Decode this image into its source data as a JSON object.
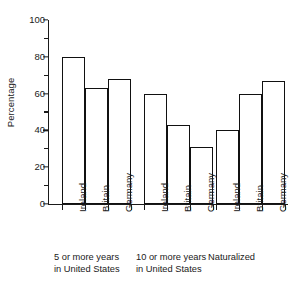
{
  "chart_data": {
    "type": "bar",
    "title": "",
    "subtitle": "",
    "xlabel": "",
    "ylabel": "Percentage",
    "ylim": [
      0,
      100
    ],
    "y_ticks_major": [
      0,
      20,
      40,
      60,
      80,
      100
    ],
    "y_ticks_minor": [
      10,
      30,
      50,
      70,
      90
    ],
    "y_tick_labels": [
      "0",
      "20",
      "40",
      "60",
      "80",
      "100"
    ],
    "grid": false,
    "legend": null,
    "categories": [
      "Ireland",
      "Britain",
      "Germany"
    ],
    "groups": [
      {
        "caption_line1": "5 or more years",
        "caption_line2": "in United States",
        "bars": [
          {
            "category": "Ireland",
            "value": 80
          },
          {
            "category": "Britain",
            "value": 63
          },
          {
            "category": "Germany",
            "value": 68
          }
        ]
      },
      {
        "caption_line1": "10 or more years",
        "caption_line2": "in United States",
        "bars": [
          {
            "category": "Ireland",
            "value": 60
          },
          {
            "category": "Britain",
            "value": 43
          },
          {
            "category": "Germany",
            "value": 31
          }
        ]
      },
      {
        "caption_line1": "Naturalized",
        "caption_line2": "",
        "bars": [
          {
            "category": "Ireland",
            "value": 40
          },
          {
            "category": "Britain",
            "value": 60
          },
          {
            "category": "Germany",
            "value": 67
          }
        ]
      }
    ],
    "series": [
      {
        "name": "Ireland",
        "values": [
          80,
          60,
          40
        ]
      },
      {
        "name": "Britain",
        "values": [
          63,
          43,
          60
        ]
      },
      {
        "name": "Germany",
        "values": [
          68,
          31,
          67
        ]
      }
    ],
    "colors": {
      "bar_fill": "#ffffff",
      "bar_stroke": "#111111",
      "axis": "#1a1a1a",
      "text": "#1a1a1a",
      "background": "#ffffff"
    }
  }
}
